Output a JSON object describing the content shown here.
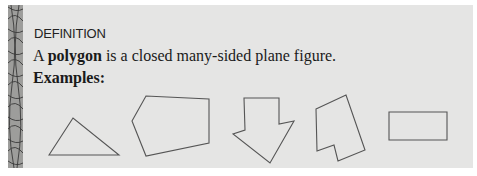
{
  "box": {
    "heading": "DEFINITION",
    "definition": {
      "prefix": "A ",
      "term": "polygon",
      "suffix": " is a closed many-sided plane figure."
    },
    "examples_label": "Examples:",
    "examples": [
      {
        "name": "triangle",
        "points": "49,155 73,118 119,155"
      },
      {
        "name": "pentagon",
        "points": "132,121 146,96 209,99 209,143 146,156"
      },
      {
        "name": "arrow",
        "points": "244,98 279,98 279,124 294,121 270,163 233,134 245,130"
      },
      {
        "name": "irregular-hexagon",
        "points": "316,109 346,95 365,150 338,161 334,145 317,151"
      },
      {
        "name": "rectangle",
        "points": "389,112 447,112 447,140 389,140"
      }
    ]
  },
  "colors": {
    "panel_bg": "#e5e5e4",
    "strip_bg": "#9d9d9b",
    "stroke": "#555555"
  }
}
